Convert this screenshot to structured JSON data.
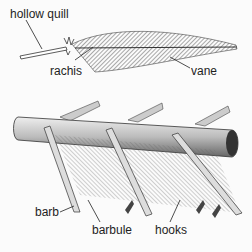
{
  "diagram": {
    "labels": {
      "hollow_quill": "hollow quill",
      "rachis": "rachis",
      "vane": "vane",
      "barb": "barb",
      "barbule": "barbule",
      "hooks": "hooks"
    },
    "colors": {
      "ink": "#222222",
      "shade": "#8a8a8a",
      "background": "#fbfbfb"
    }
  }
}
